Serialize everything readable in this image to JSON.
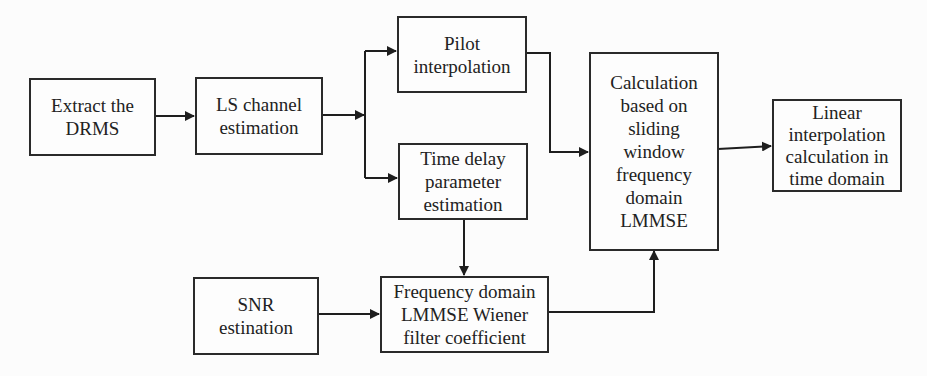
{
  "diagram": {
    "type": "flowchart",
    "nodes": [
      {
        "id": "extract",
        "label": "Extract the\nDRMS"
      },
      {
        "id": "ls",
        "label": "LS channel\nestimation"
      },
      {
        "id": "pilot",
        "label": "Pilot\ninterpolation"
      },
      {
        "id": "timedelay",
        "label": "Time delay\nparameter\nestimation"
      },
      {
        "id": "calc",
        "label": "Calculation\nbased on\nsliding\nwindow\nfrequency\ndomain\nLMMSE"
      },
      {
        "id": "linear",
        "label": "Linear\ninterpolation\ncalculation in\ntime domain"
      },
      {
        "id": "snr",
        "label": "SNR\nestination"
      },
      {
        "id": "freq",
        "label": "Frequency domain\nLMMSE Wiener\nfilter coefficient"
      }
    ],
    "edges": [
      {
        "from": "extract",
        "to": "ls"
      },
      {
        "from": "ls",
        "to": "pilot"
      },
      {
        "from": "ls",
        "to": "timedelay"
      },
      {
        "from": "pilot",
        "to": "calc"
      },
      {
        "from": "timedelay",
        "to": "freq"
      },
      {
        "from": "snr",
        "to": "freq"
      },
      {
        "from": "freq",
        "to": "calc"
      },
      {
        "from": "calc",
        "to": "linear"
      }
    ],
    "colors": {
      "line": "#1e1e1e",
      "border": "#2a2a2a",
      "background": "#fcfcfc"
    }
  }
}
